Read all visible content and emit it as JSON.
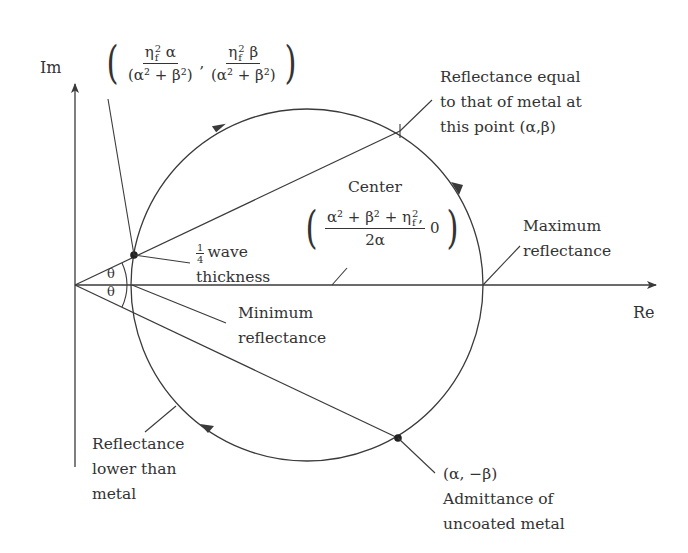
{
  "colors": {
    "line": "#3a3a3a",
    "text": "#333333",
    "background": "#ffffff"
  },
  "axes": {
    "im_label": "Im",
    "re_label": "Re"
  },
  "geometry": {
    "origin": [
      75,
      285
    ],
    "circle_center": [
      307,
      285
    ],
    "circle_radius": 176,
    "quarter_wave_point": [
      134,
      255
    ],
    "metal_point_reflect": [
      400,
      131
    ],
    "uncoated_metal_point": [
      398,
      438
    ]
  },
  "top_formula": {
    "num1_eta": "η",
    "num1_sub": "f",
    "num1_sup": "2",
    "num1_var": "α",
    "den": "(α² + β²)",
    "separator": ",",
    "num2_eta": "η",
    "num2_sub": "f",
    "num2_sup": "2",
    "num2_var": "β"
  },
  "center_label": {
    "title": "Center",
    "numerator": "α² + β² + η",
    "num_sup": "2",
    "num_sub": "f",
    "comma": ",",
    "denominator": "2α",
    "second": "0"
  },
  "labels": {
    "reflectance_equal": [
      "Reflectance equal",
      "to that of metal at",
      "this point (α,β)"
    ],
    "maximum": [
      "Maximum",
      "reflectance"
    ],
    "minimum": [
      "Minimum",
      "reflectance"
    ],
    "quarter_wave": {
      "frac_num": "1",
      "frac_den": "4",
      "line1": "wave",
      "line2": "thickness"
    },
    "theta_upper": "θ",
    "theta_lower": "θ",
    "lower_than_metal": [
      "Reflectance",
      "lower than",
      "metal"
    ],
    "uncoated": [
      "(α, −β)",
      "Admittance of",
      "uncoated metal"
    ]
  }
}
